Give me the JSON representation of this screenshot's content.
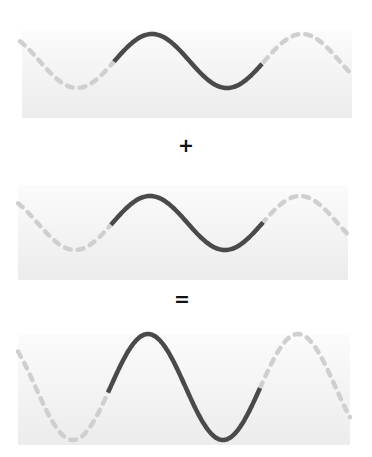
{
  "diagram": {
    "colors": {
      "background": "#ffffff",
      "panel_top": "#fbfbfb",
      "panel_bottom": "#ececec",
      "solid_wave": "#4a4a4a",
      "dashed_wave": "#cfcfcf",
      "operator": "#111111"
    },
    "operators": {
      "plus": "+",
      "equals": "="
    },
    "panels": [
      {
        "name": "wave-1",
        "label": "Wave 1",
        "box": {
          "x": 22,
          "y": 30,
          "w": 330,
          "h": 88
        },
        "center_y": 61,
        "amplitude": 27,
        "wavelength": 150,
        "peak_x": 152,
        "x_start": 20,
        "x_end": 352,
        "solid_start": 114,
        "solid_end": 262
      },
      {
        "name": "wave-2",
        "label": "Wave 2",
        "box": {
          "x": 18,
          "y": 185,
          "w": 330,
          "h": 95
        },
        "center_y": 223,
        "amplitude": 27,
        "wavelength": 150,
        "peak_x": 150,
        "x_start": 18,
        "x_end": 348,
        "solid_start": 111,
        "solid_end": 263
      },
      {
        "name": "resultant-wave",
        "label": "Resultant wave (sum)",
        "box": {
          "x": 18,
          "y": 335,
          "w": 332,
          "h": 110
        },
        "center_y": 387,
        "amplitude": 53,
        "wavelength": 150,
        "peak_x": 148,
        "x_start": 18,
        "x_end": 350,
        "solid_start": 108,
        "solid_end": 260
      }
    ]
  }
}
